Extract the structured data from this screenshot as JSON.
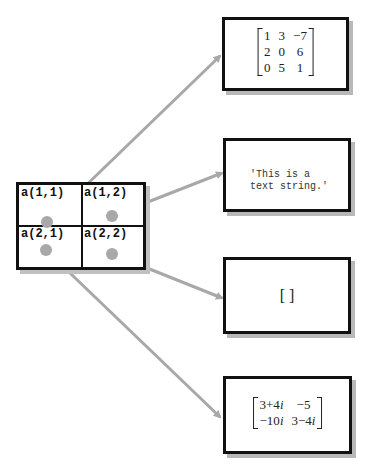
{
  "cell_array": {
    "cells": [
      "a(1,1)",
      "a(1,2)",
      "a(2,1)",
      "a(2,2)"
    ]
  },
  "contents": {
    "numeric_matrix": [
      [
        "1",
        "3",
        "−7"
      ],
      [
        "2",
        "0",
        "6"
      ],
      [
        "0",
        "5",
        "1"
      ]
    ],
    "text_string": [
      "'This is a",
      "text string.'"
    ],
    "empty_array": "[ ]",
    "complex_matrix": [
      [
        "3+4i",
        "−5"
      ],
      [
        "−10i",
        "3−4i"
      ]
    ]
  },
  "colors": {
    "arrow": "#a8a8a8",
    "border": "#111111",
    "shadow": "#b8b8b8"
  }
}
